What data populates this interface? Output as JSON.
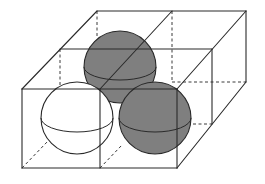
{
  "figure": {
    "caption": "",
    "colors": {
      "edge": "#2a2a2a",
      "sphere_shaded": "#7f7f7f",
      "sphere_unshaded": "#ffffff",
      "background": "#ffffff"
    },
    "box": {
      "cells_wide": 2,
      "cells_deep": 2,
      "cells_high": 1
    },
    "spheres": [
      {
        "id": "back-left",
        "shade": "gray",
        "cx": 120,
        "cy": 67,
        "r": 36
      },
      {
        "id": "front-left",
        "shade": "white",
        "cx": 77,
        "cy": 118,
        "r": 36
      },
      {
        "id": "front-right",
        "shade": "gray",
        "cx": 155,
        "cy": 118,
        "r": 36
      }
    ]
  }
}
